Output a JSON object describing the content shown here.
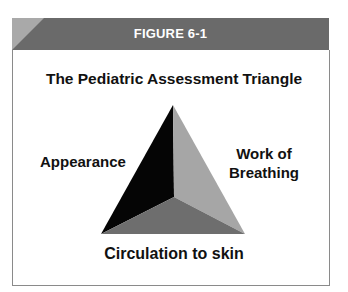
{
  "figure": {
    "label": "FIGURE 6-1",
    "title": "The Pediatric Assessment Triangle"
  },
  "triangle": {
    "sides": [
      {
        "name": "Appearance",
        "lines": [
          "Appearance"
        ],
        "color": "#050505"
      },
      {
        "name": "Work of Breathing",
        "lines": [
          "Work of",
          "Breathing"
        ],
        "color": "#a6a6a6"
      },
      {
        "name": "Circulation to skin",
        "lines": [
          "Circulation to skin"
        ],
        "color": "#6e6e6e"
      }
    ]
  },
  "colors": {
    "header_bg": "#6a6a6a",
    "header_corner": "#a9a9a9",
    "border": "#8a8a8a"
  }
}
